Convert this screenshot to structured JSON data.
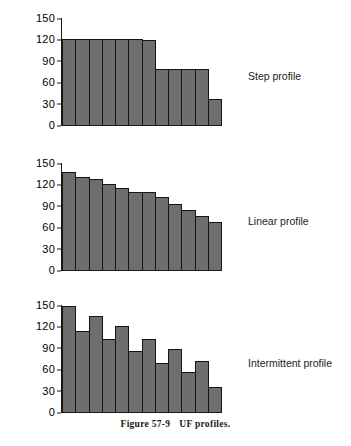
{
  "figure": {
    "caption_number": "Figure 57-9",
    "caption_text": "UF profiles."
  },
  "axis": {
    "ticks": [
      "150",
      "120",
      "90",
      "60",
      "30",
      "0"
    ],
    "ymin": 0,
    "ymax": 150
  },
  "chart_data": [
    {
      "type": "bar",
      "title": "Step profile",
      "xlabel": "",
      "ylabel": "",
      "ylim": [
        0,
        150
      ],
      "yticks": [
        0,
        30,
        60,
        90,
        120,
        150
      ],
      "grid": false,
      "categories": [
        "1",
        "2",
        "3",
        "4",
        "5",
        "6",
        "7",
        "8",
        "9",
        "10",
        "11",
        "12"
      ],
      "values": [
        120,
        120,
        120,
        120,
        120,
        120,
        119,
        78,
        78,
        78,
        78,
        37
      ],
      "bar_color": "#6e6e6e",
      "bar_edge_color": "#141414"
    },
    {
      "type": "bar",
      "title": "Linear profile",
      "xlabel": "",
      "ylabel": "",
      "ylim": [
        0,
        150
      ],
      "yticks": [
        0,
        30,
        60,
        90,
        120,
        150
      ],
      "grid": false,
      "categories": [
        "1",
        "2",
        "3",
        "4",
        "5",
        "6",
        "7",
        "8",
        "9",
        "10",
        "11",
        "12"
      ],
      "values": [
        137,
        131,
        127,
        120,
        115,
        110,
        110,
        102,
        93,
        84,
        76,
        68
      ],
      "bar_color": "#6e6e6e",
      "bar_edge_color": "#141414"
    },
    {
      "type": "bar",
      "title": "Intermittent profile",
      "xlabel": "",
      "ylabel": "",
      "ylim": [
        0,
        150
      ],
      "yticks": [
        0,
        30,
        60,
        90,
        120,
        150
      ],
      "grid": false,
      "categories": [
        "1",
        "2",
        "3",
        "4",
        "5",
        "6",
        "7",
        "8",
        "9",
        "10",
        "11",
        "12"
      ],
      "values": [
        149,
        113,
        135,
        102,
        120,
        86,
        103,
        69,
        88,
        56,
        72,
        35
      ],
      "bar_color": "#6e6e6e",
      "bar_edge_color": "#141414"
    }
  ]
}
